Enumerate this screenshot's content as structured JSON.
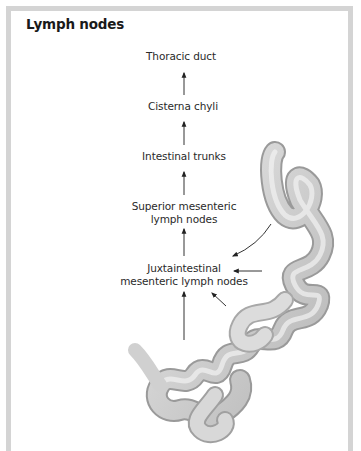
{
  "figure": {
    "title": "Lymph nodes",
    "colors": {
      "frame": "#d4d4d4",
      "text": "#2a2a2a",
      "arrow": "#333333",
      "intestine": "#c8c8c8"
    },
    "flow": [
      {
        "id": "thoracic_duct",
        "label": "Thoracic duct"
      },
      {
        "id": "cisterna_chyli",
        "label": "Cisterna chyli"
      },
      {
        "id": "intestinal_trunks",
        "label": "Intestinal trunks"
      },
      {
        "id": "superior_mesenteric",
        "label_line1": "Superior mesenteric",
        "label_line2": "lymph nodes"
      },
      {
        "id": "juxtaintestinal",
        "label_line1": "Juxtaintestinal",
        "label_line2": "mesenteric lymph nodes"
      }
    ],
    "illustration": "small-intestine-loops"
  }
}
